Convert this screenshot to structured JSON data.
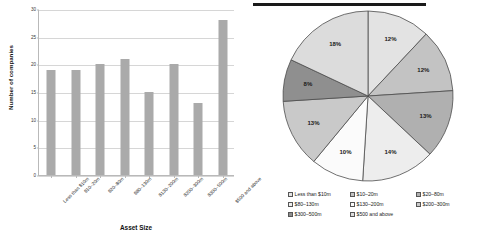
{
  "figure": {
    "has_top_rule": true
  },
  "chart_data": [
    {
      "type": "bar",
      "title": "",
      "xlabel": "Asset Size",
      "ylabel": "Number of companies",
      "categories": [
        "Less than $10m",
        "$10–20m",
        "$20–80m",
        "$80–130m",
        "$130–200m",
        "$200–300m",
        "$300–500m",
        "$500 and above"
      ],
      "values": [
        19,
        19,
        20,
        21,
        15,
        20,
        13,
        28
      ],
      "ylim": [
        0,
        30
      ],
      "yticks": [
        0,
        5,
        10,
        15,
        20,
        25,
        30
      ],
      "ytick_labels": [
        "0",
        "5",
        "10",
        "15",
        "20",
        "25",
        "30"
      ],
      "grid": true,
      "legend": "none",
      "bar_color": "#aaaaaa"
    },
    {
      "type": "pie",
      "title": "",
      "start_angle_deg": 0,
      "direction": "clockwise",
      "labels": [
        "Less than $10m",
        "$10–20m",
        "$20–80m",
        "$80–130m",
        "$130–200m",
        "$200–300m",
        "$300–500m",
        "$500 and above"
      ],
      "values": [
        12,
        12,
        13,
        14,
        10,
        13,
        8,
        18
      ],
      "value_labels": [
        "12%",
        "12%",
        "13%",
        "14%",
        "10%",
        "13%",
        "8%",
        "18%"
      ],
      "colors": [
        "#e3e3e3",
        "#c3c3c3",
        "#b0b0b0",
        "#ededed",
        "#fbfbfb",
        "#c9c9c9",
        "#8f8f8f",
        "#dcdcdc"
      ],
      "legend_position": "bottom"
    }
  ],
  "legend": {
    "items": [
      {
        "label": "Less than $10m",
        "color": "#e3e3e3"
      },
      {
        "label": "$10–20m",
        "color": "#c3c3c3"
      },
      {
        "label": "$20–80m",
        "color": "#b0b0b0"
      },
      {
        "label": "$80–130m",
        "color": "#ededed"
      },
      {
        "label": "$130–200m",
        "color": "#fbfbfb"
      },
      {
        "label": "$200–300m",
        "color": "#c9c9c9"
      },
      {
        "label": "$300–500m",
        "color": "#8f8f8f"
      },
      {
        "label": "$500 and above",
        "color": "#dcdcdc"
      }
    ]
  }
}
